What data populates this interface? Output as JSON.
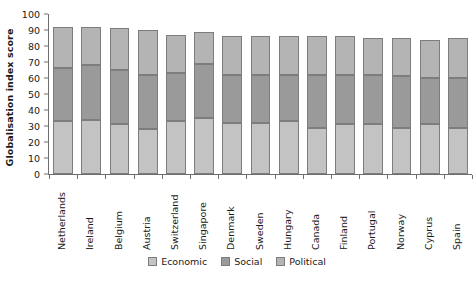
{
  "chart_data": {
    "type": "bar",
    "stacked": true,
    "title": "",
    "xlabel": "",
    "ylabel": "Globalisation index score",
    "ylim": [
      0,
      100
    ],
    "ytick_step": 10,
    "yticks": [
      0,
      10,
      20,
      30,
      40,
      50,
      60,
      70,
      80,
      90,
      100
    ],
    "grid": false,
    "legend_position": "bottom",
    "categories": [
      "Netherlands",
      "Ireland",
      "Belgium",
      "Austria",
      "Switzerland",
      "Singapore",
      "Denmark",
      "Sweden",
      "Hungary",
      "Canada",
      "Finland",
      "Portugal",
      "Norway",
      "Cyprus",
      "Spain"
    ],
    "series": [
      {
        "name": "Economic",
        "color": "#c3c3c3",
        "values": [
          33,
          34,
          31,
          28,
          33,
          35,
          32,
          32,
          33,
          29,
          31,
          31,
          29,
          31,
          29
        ]
      },
      {
        "name": "Social",
        "color": "#9a9a9a",
        "values": [
          33,
          34,
          34,
          34,
          30,
          34,
          30,
          30,
          29,
          33,
          31,
          31,
          32,
          29,
          31
        ]
      },
      {
        "name": "Political",
        "color": "#b4b4b4",
        "values": [
          26,
          24,
          26,
          28,
          24,
          20,
          24,
          24,
          24,
          24,
          24,
          23,
          24,
          24,
          25
        ]
      }
    ],
    "totals": [
      92,
      92,
      91,
      90,
      87,
      89,
      86,
      86,
      86,
      86,
      86,
      85,
      85,
      84,
      85
    ]
  },
  "legend": {
    "items": [
      {
        "label": "Economic"
      },
      {
        "label": "Social"
      },
      {
        "label": "Political"
      }
    ]
  }
}
